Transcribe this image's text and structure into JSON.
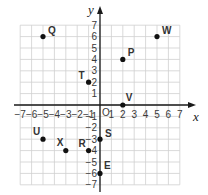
{
  "plane": {
    "x_axis_label": "x",
    "y_axis_label": "y",
    "origin_label": "O",
    "x_range": [
      -7,
      7
    ],
    "y_range": [
      -7,
      7
    ],
    "x_ticks": [
      "-7",
      "-6",
      "-5",
      "-4",
      "-3",
      "-2",
      "-1",
      "1",
      "2",
      "3",
      "4",
      "5",
      "6",
      "7"
    ],
    "y_ticks": [
      "7",
      "6",
      "5",
      "4",
      "3",
      "2",
      "1",
      "-1",
      "-2",
      "-3",
      "-4",
      "-5",
      "-6",
      "-7"
    ],
    "grid_color": "#cfcfcf",
    "axis_color": "#1a1a1a",
    "point_color": "#111111"
  },
  "points": [
    {
      "label": "Q",
      "x": -5,
      "y": 6
    },
    {
      "label": "T",
      "x": -1,
      "y": 2
    },
    {
      "label": "P",
      "x": 2,
      "y": 4
    },
    {
      "label": "W",
      "x": 5,
      "y": 6
    },
    {
      "label": "V",
      "x": 2,
      "y": 0
    },
    {
      "label": "U",
      "x": -5,
      "y": -3
    },
    {
      "label": "X",
      "x": -3,
      "y": -4
    },
    {
      "label": "R",
      "x": -1,
      "y": -4
    },
    {
      "label": "S",
      "x": 0,
      "y": -3
    },
    {
      "label": "E",
      "x": 0,
      "y": -6
    }
  ],
  "chart_data": {
    "type": "scatter",
    "title": "",
    "xlabel": "x",
    "ylabel": "y",
    "xlim": [
      -7,
      7
    ],
    "ylim": [
      -7,
      7
    ],
    "grid": true,
    "series": [
      {
        "name": "points",
        "labels": [
          "Q",
          "T",
          "P",
          "W",
          "V",
          "U",
          "X",
          "R",
          "S",
          "E"
        ],
        "x": [
          -5,
          -1,
          2,
          5,
          2,
          -5,
          -3,
          -1,
          0,
          0
        ],
        "y": [
          6,
          2,
          4,
          6,
          0,
          -3,
          -4,
          -4,
          -3,
          -6
        ]
      }
    ]
  }
}
